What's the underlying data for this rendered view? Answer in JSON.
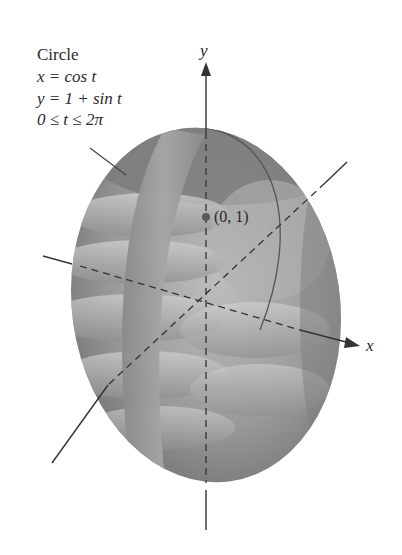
{
  "figure": {
    "annotation": {
      "title": "Circle",
      "line_x": "x = cos t",
      "line_y": "y = 1 + sin t",
      "line_t": "0 ≤ t ≤ 2π"
    },
    "point_label": "(0, 1)",
    "axis_labels": {
      "x": "x",
      "y": "y"
    },
    "colors": {
      "surface_dark": "#6f6f6f",
      "surface_mid": "#8e8e8e",
      "surface_light": "#b9b9b9",
      "axis": "#333333",
      "point": "#5a5a5a",
      "background": "#ffffff"
    }
  }
}
